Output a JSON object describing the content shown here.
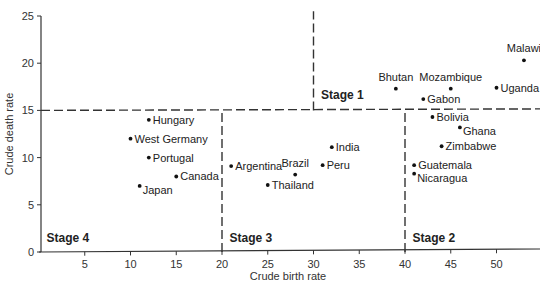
{
  "chart_data": {
    "type": "scatter",
    "title": "",
    "xlabel": "Crude birth rate",
    "ylabel": "Crude death rate",
    "xlim": [
      0,
      54
    ],
    "ylim": [
      0,
      25
    ],
    "x_ticks": [
      5,
      10,
      15,
      20,
      25,
      30,
      35,
      40,
      45,
      50
    ],
    "y_ticks": [
      0,
      5,
      10,
      15,
      20,
      25
    ],
    "grid": false,
    "legend": null,
    "points": [
      {
        "label": "Hungary",
        "x": 12,
        "y": 14,
        "label_pos": "right"
      },
      {
        "label": "West Germany",
        "x": 10,
        "y": 12,
        "label_pos": "right"
      },
      {
        "label": "Portugal",
        "x": 12,
        "y": 10,
        "label_pos": "right"
      },
      {
        "label": "Canada",
        "x": 15,
        "y": 8,
        "label_pos": "right"
      },
      {
        "label": "Japan",
        "x": 11,
        "y": 7,
        "label_pos": "right-below"
      },
      {
        "label": "Argentina",
        "x": 21,
        "y": 9.1,
        "label_pos": "right"
      },
      {
        "label": "Thailand",
        "x": 25,
        "y": 7.1,
        "label_pos": "right"
      },
      {
        "label": "Brazil",
        "x": 28,
        "y": 8.2,
        "label_pos": "above"
      },
      {
        "label": "Peru",
        "x": 31,
        "y": 9.2,
        "label_pos": "right"
      },
      {
        "label": "India",
        "x": 32,
        "y": 11.1,
        "label_pos": "right"
      },
      {
        "label": "Bhutan",
        "x": 39,
        "y": 17.3,
        "label_pos": "above"
      },
      {
        "label": "Mozambique",
        "x": 45,
        "y": 17.3,
        "label_pos": "above"
      },
      {
        "label": "Malawi",
        "x": 53,
        "y": 20.3,
        "label_pos": "above"
      },
      {
        "label": "Uganda",
        "x": 50,
        "y": 17.4,
        "label_pos": "right"
      },
      {
        "label": "Gabon",
        "x": 42,
        "y": 16.2,
        "label_pos": "right"
      },
      {
        "label": "Bolivia",
        "x": 43,
        "y": 14.3,
        "label_pos": "right"
      },
      {
        "label": "Ghana",
        "x": 46,
        "y": 13.2,
        "label_pos": "right-below"
      },
      {
        "label": "Zimbabwe",
        "x": 44,
        "y": 11.2,
        "label_pos": "right"
      },
      {
        "label": "Guatemala",
        "x": 41,
        "y": 9.2,
        "label_pos": "right"
      },
      {
        "label": "Nicaragua",
        "x": 41,
        "y": 8.3,
        "label_pos": "right-below"
      }
    ],
    "annotations": [
      {
        "text": "Stage 1",
        "x": 30.5,
        "y": 16.0
      },
      {
        "text": "Stage 2",
        "x": 40.5,
        "y": 0.8
      },
      {
        "text": "Stage 3",
        "x": 20.5,
        "y": 0.8
      },
      {
        "text": "Stage 4",
        "x": 0.5,
        "y": 0.8
      }
    ],
    "divider_lines": [
      {
        "orientation": "horizontal",
        "y": 15,
        "x_from": 0,
        "x_to": 54,
        "style": "dashed"
      },
      {
        "orientation": "vertical",
        "x": 20,
        "y_from": 0,
        "y_to": 15,
        "style": "dashed"
      },
      {
        "orientation": "vertical",
        "x": 40,
        "y_from": 0,
        "y_to": 15,
        "style": "dashed"
      },
      {
        "orientation": "vertical",
        "x": 30,
        "y_from": 15,
        "y_to": 25.5,
        "style": "dashed"
      }
    ]
  }
}
